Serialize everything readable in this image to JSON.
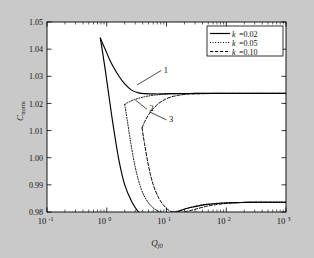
{
  "figure": {
    "background_color": "#c9c9c9",
    "plot_background_color": "#ffffff",
    "axes_color": "#000000"
  },
  "chart_data": {
    "type": "line",
    "title": "",
    "subtitle": "",
    "xlabel": "Q_f0",
    "xlabel_base": "Q",
    "xlabel_sub": "f0",
    "ylabel": "C_norm",
    "ylabel_base": "C",
    "ylabel_sub": "norm",
    "xscale": "log",
    "yscale": "linear",
    "xlim": [
      0.1,
      1000
    ],
    "ylim": [
      0.98,
      1.05
    ],
    "grid": false,
    "xticks": [
      "10^-1",
      "10^0",
      "10^1",
      "10^2",
      "10^3"
    ],
    "xtick_labels": [
      "10",
      "10",
      "10",
      "10",
      "10"
    ],
    "xtick_exponents": [
      "-1",
      "0",
      "1",
      "2",
      "3"
    ],
    "yticks": [
      0.98,
      0.99,
      1.0,
      1.01,
      1.02,
      1.03,
      1.04,
      1.05
    ],
    "ytick_labels": [
      "0.98",
      "0.99",
      "1.00",
      "1.01",
      "1.02",
      "1.03",
      "1.04",
      "1.05"
    ],
    "legend": {
      "position": "upper-right",
      "entries": [
        {
          "label": "k =0.02",
          "symbol": "k",
          "value": "0.02",
          "style": "solid"
        },
        {
          "label": "k =0.05",
          "symbol": "k",
          "value": "0.05",
          "style": "dotted"
        },
        {
          "label": "k =0.10",
          "symbol": "k",
          "value": "0.10",
          "style": "dashed"
        }
      ]
    },
    "annotations": [
      {
        "text": "1",
        "x": 9.0,
        "y": 1.0325,
        "points_to_x": 3.2,
        "points_to_y": 1.0268
      },
      {
        "text": "2",
        "x": 5.2,
        "y": 1.0182,
        "points_to_x": 3.0,
        "points_to_y": 1.0213
      },
      {
        "text": "3",
        "x": 11.0,
        "y": 1.0143,
        "points_to_x": 5.2,
        "points_to_y": 1.0169
      }
    ],
    "asymptotes": {
      "upper": 1.0237,
      "lower": 0.9836
    },
    "series": [
      {
        "name": "k =0.02",
        "style": "solid",
        "branch": "upper",
        "x": [
          0.78,
          0.85,
          0.95,
          1.1,
          1.3,
          1.6,
          2.0,
          2.6,
          3.4,
          4.5,
          6.0,
          8.0,
          11,
          15,
          21,
          30,
          45,
          70,
          110,
          180,
          300,
          550,
          1000
        ],
        "y": [
          1.0441,
          1.0422,
          1.0398,
          1.0365,
          1.0333,
          1.03,
          1.0272,
          1.0249,
          1.0239,
          1.0236,
          1.0235,
          1.0235,
          1.0236,
          1.0236,
          1.0236,
          1.0237,
          1.0237,
          1.0237,
          1.0237,
          1.0237,
          1.0237,
          1.0237,
          1.0237
        ]
      },
      {
        "name": "k =0.02",
        "style": "solid",
        "branch": "lower",
        "x": [
          0.78,
          0.85,
          0.95,
          1.1,
          1.3,
          1.6,
          2.0,
          2.6,
          3.4,
          4.5,
          6.0,
          8.0,
          11,
          15,
          21,
          30,
          45,
          70,
          110,
          180,
          300,
          550,
          1000
        ],
        "y": [
          1.0441,
          1.039,
          1.032,
          1.022,
          1.011,
          0.999,
          0.99,
          0.984,
          0.98,
          0.978,
          0.9775,
          0.978,
          0.979,
          0.98,
          0.9812,
          0.982,
          0.9827,
          0.9831,
          0.9834,
          0.9835,
          0.9836,
          0.9836,
          0.9836
        ]
      },
      {
        "name": "k =0.05",
        "style": "dotted",
        "branch": "upper",
        "x": [
          2.0,
          2.2,
          2.5,
          3.0,
          3.7,
          4.6,
          6.0,
          8.0,
          11,
          15,
          21,
          30,
          45,
          70,
          110,
          180,
          300,
          550,
          1000
        ],
        "y": [
          1.0196,
          1.0202,
          1.0208,
          1.0215,
          1.0221,
          1.0226,
          1.023,
          1.0233,
          1.0235,
          1.0236,
          1.0236,
          1.0237,
          1.0237,
          1.0237,
          1.0237,
          1.0237,
          1.0237,
          1.0237,
          1.0237
        ]
      },
      {
        "name": "k =0.05",
        "style": "dotted",
        "branch": "lower",
        "x": [
          2.0,
          2.2,
          2.5,
          3.0,
          3.7,
          4.6,
          6.0,
          8.0,
          11,
          15,
          21,
          30,
          45,
          70,
          110,
          180,
          300,
          550,
          1000
        ],
        "y": [
          1.0196,
          1.014,
          1.006,
          0.9965,
          0.989,
          0.9845,
          0.9815,
          0.98,
          0.9798,
          0.9803,
          0.9812,
          0.9821,
          0.9828,
          0.9832,
          0.9834,
          0.9835,
          0.9836,
          0.9836,
          0.9836
        ]
      },
      {
        "name": "k =0.10",
        "style": "dashed",
        "branch": "upper",
        "x": [
          3.9,
          4.3,
          5.0,
          6.0,
          7.5,
          9.5,
          12,
          16,
          22,
          30,
          45,
          70,
          110,
          180,
          300,
          550,
          1000
        ],
        "y": [
          1.011,
          1.0132,
          1.0158,
          1.0181,
          1.0201,
          1.0215,
          1.0224,
          1.023,
          1.0234,
          1.0235,
          1.0236,
          1.0237,
          1.0237,
          1.0237,
          1.0237,
          1.0237,
          1.0237
        ]
      },
      {
        "name": "k =0.10",
        "style": "dashed",
        "branch": "lower",
        "x": [
          3.9,
          4.3,
          5.0,
          6.0,
          7.5,
          9.5,
          12,
          16,
          22,
          30,
          45,
          70,
          110,
          180,
          300,
          550,
          1000
        ],
        "y": [
          1.011,
          1.005,
          0.997,
          0.99,
          0.985,
          0.9818,
          0.9802,
          0.9797,
          0.9802,
          0.981,
          0.982,
          0.9828,
          0.9832,
          0.9835,
          0.9836,
          0.9836,
          0.9836
        ]
      }
    ]
  }
}
